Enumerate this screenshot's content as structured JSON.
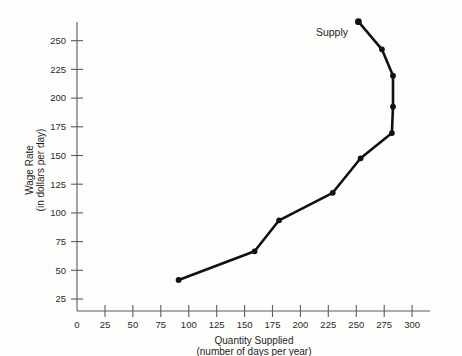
{
  "chart_data": {
    "type": "line",
    "title": "",
    "xlabel": "Quantity Supplied",
    "xlabel_sub": "(number of days per year)",
    "ylabel": "Wage Rate",
    "ylabel_sub": "(in dollars per day)",
    "series_label": "Supply",
    "grid": false,
    "legend_position": "inline-right-top",
    "xlim": [
      0,
      310
    ],
    "ylim": [
      0,
      265
    ],
    "xticks": [
      0,
      25,
      50,
      75,
      100,
      125,
      150,
      175,
      200,
      225,
      250,
      275,
      300
    ],
    "yticks": [
      25,
      50,
      75,
      100,
      125,
      150,
      175,
      200,
      225,
      250
    ],
    "xtick_labels": [
      "0",
      "25",
      "50",
      "75",
      "100",
      "125",
      "150",
      "175",
      "200",
      "225",
      "250",
      "275",
      "300"
    ],
    "ytick_labels": [
      "25",
      "50",
      "75",
      "100",
      "125",
      "150",
      "175",
      "200",
      "225",
      "250"
    ],
    "series": [
      {
        "name": "Supply",
        "x": [
          91,
          159,
          181,
          229,
          254,
          282,
          283,
          283,
          273,
          252
        ],
        "y": [
          27,
          52,
          79,
          103,
          133,
          155,
          178,
          205,
          228,
          252
        ]
      }
    ],
    "point_marker": "filled-circle",
    "line_color": "#111111",
    "axis_color": "#5d5d5d"
  }
}
